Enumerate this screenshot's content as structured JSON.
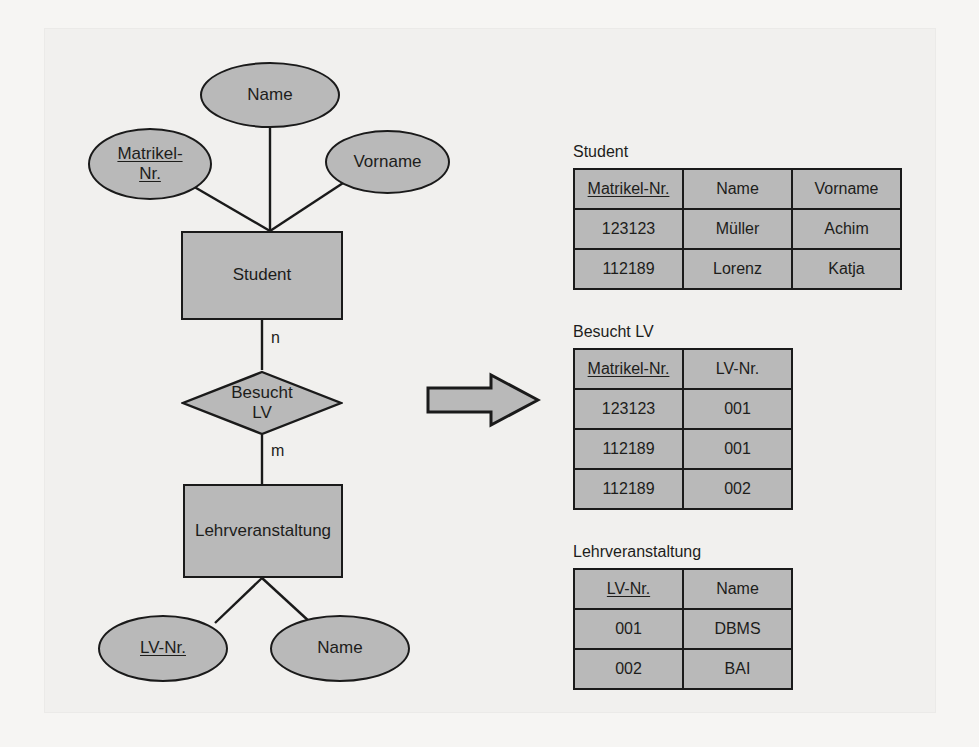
{
  "diagram": {
    "entities": [
      {
        "id": "student",
        "label": "Student"
      },
      {
        "id": "lehrveranstaltung",
        "label": "Lehrveranstaltung"
      }
    ],
    "relationship": {
      "id": "besucht-lv",
      "label_line1": "Besucht",
      "label_line2": "LV"
    },
    "attributes": [
      {
        "id": "student-name",
        "label": "Name",
        "key": false
      },
      {
        "id": "student-matrikel-nr",
        "label_line1": "Matrikel-",
        "label_line2": "Nr.",
        "key": true
      },
      {
        "id": "student-vorname",
        "label": "Vorname",
        "key": false
      },
      {
        "id": "lv-nr",
        "label": "LV-Nr.",
        "key": true
      },
      {
        "id": "lv-name",
        "label": "Name",
        "key": false
      }
    ],
    "cardinalities": {
      "student_side": "n",
      "lehrveranstaltung_side": "m"
    }
  },
  "arrow": {
    "name": "transforms-to-arrow"
  },
  "tables": [
    {
      "id": "student",
      "caption": "Student",
      "columns": [
        {
          "label": "Matrikel-Nr.",
          "key": true
        },
        {
          "label": "Name",
          "key": false
        },
        {
          "label": "Vorname",
          "key": false
        }
      ],
      "rows": [
        [
          "123123",
          "Müller",
          "Achim"
        ],
        [
          "112189",
          "Lorenz",
          "Katja"
        ]
      ]
    },
    {
      "id": "besucht-lv",
      "caption": "Besucht LV",
      "columns": [
        {
          "label": "Matrikel-Nr.",
          "key": true
        },
        {
          "label": "LV-Nr.",
          "key": false
        }
      ],
      "rows": [
        [
          "123123",
          "001"
        ],
        [
          "112189",
          "001"
        ],
        [
          "112189",
          "002"
        ]
      ]
    },
    {
      "id": "lehrveranstaltung",
      "caption": "Lehrveranstaltung",
      "columns": [
        {
          "label": "LV-Nr.",
          "key": true
        },
        {
          "label": "Name",
          "key": false
        }
      ],
      "rows": [
        [
          "001",
          "DBMS"
        ],
        [
          "002",
          "BAI"
        ]
      ]
    }
  ],
  "colors": {
    "shape_fill": "#b9b9b9",
    "outline": "#1a1a1a",
    "page_background": "#f1f0ee",
    "text": "#1d1d1b"
  }
}
